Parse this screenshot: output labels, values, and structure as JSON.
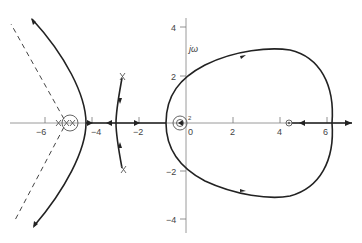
{
  "diagram": {
    "type": "root-locus",
    "imag_axis_label": "jω",
    "real_axis_ticks": [
      {
        "value": -6,
        "label": "−6"
      },
      {
        "value": -4,
        "label": "−4"
      },
      {
        "value": -2,
        "label": "−2"
      },
      {
        "value": 0,
        "label": "0"
      },
      {
        "value": 2,
        "label": "2"
      },
      {
        "value": 4,
        "label": "4"
      },
      {
        "value": 6,
        "label": "6"
      }
    ],
    "imag_axis_ticks": [
      {
        "value": 4,
        "label": "4"
      },
      {
        "value": 2,
        "label": "2"
      },
      {
        "value": -2,
        "label": "−2"
      },
      {
        "value": -4,
        "label": "−4"
      }
    ],
    "small_label_near_origin": "2",
    "poles": [
      {
        "re": -1.5,
        "im": 2,
        "symbol": "X"
      },
      {
        "re": -1.5,
        "im": -2,
        "symbol": "X"
      },
      {
        "re": -5.8,
        "im": 0,
        "symbol": "X"
      },
      {
        "re": -5.0,
        "im": 0,
        "symbol": "X (double, circled)"
      }
    ],
    "zeros": [
      {
        "re": -0.3,
        "im": 0,
        "symbol": "O (double, circled)"
      },
      {
        "re": 4.5,
        "im": 0,
        "symbol": "O"
      }
    ],
    "branches": [
      "Large closed loop from origin region through ±3j, crossing real axis near +6.1",
      "Hyperbola-like branch from real axis near −4.4 going to asymptotes at upper-left and lower-left",
      "Dashed asymptotes from about −5.2 on real axis",
      "Branches from complex poles at −1.5±2j converging to real axis near −3",
      "Real-axis segments with arrows between −4.5 and −2, and beyond +6"
    ]
  }
}
